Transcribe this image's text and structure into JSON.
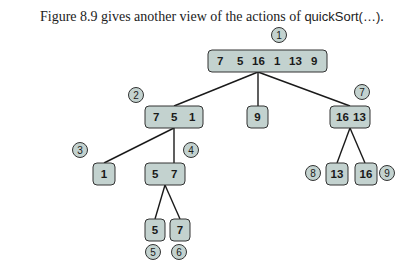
{
  "caption": {
    "prefix": "Figure 8.9 gives another view of the actions of ",
    "code": "quickSort(…)",
    "suffix": "."
  },
  "tree": {
    "root": {
      "values": [
        "7",
        "5",
        "16",
        "1",
        "13",
        "9"
      ],
      "step": "1"
    },
    "left": {
      "values": [
        "7",
        "5",
        "1"
      ],
      "step": "2"
    },
    "pivot_root": {
      "values": [
        "9"
      ]
    },
    "right": {
      "values": [
        "16",
        "13"
      ],
      "step": "7"
    },
    "left_left": {
      "values": [
        "1"
      ],
      "step": "3"
    },
    "left_right": {
      "values": [
        "5",
        "7"
      ],
      "step": "4"
    },
    "lr_left": {
      "values": [
        "5"
      ],
      "step": "5"
    },
    "lr_right": {
      "values": [
        "7"
      ],
      "step": "6"
    },
    "right_left": {
      "values": [
        "13"
      ],
      "step": "8"
    },
    "right_right": {
      "values": [
        "16"
      ],
      "step": "9"
    }
  },
  "colors": {
    "node_fill": "#c3d2cf",
    "stroke": "#333333"
  }
}
